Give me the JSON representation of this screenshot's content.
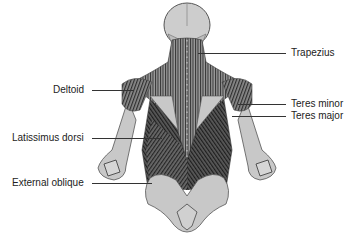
{
  "figure": {
    "colors": {
      "bone": "#c8c8c8",
      "bone_outline": "#555555",
      "muscle_dark": "#3a3a3a",
      "muscle_mid": "#707070",
      "muscle_light": "#a8a8a8",
      "leader_line": "#333333",
      "text": "#222222"
    }
  },
  "labels": {
    "left": [
      {
        "text": "Deltoid",
        "y": 90
      },
      {
        "text": "Latissimus dorsi",
        "y": 138
      },
      {
        "text": "External oblique",
        "y": 183
      }
    ],
    "right": [
      {
        "text": "Trapezius",
        "y": 53
      },
      {
        "text": "Teres minor",
        "y": 104
      },
      {
        "text": "Teres major",
        "y": 116
      }
    ]
  }
}
